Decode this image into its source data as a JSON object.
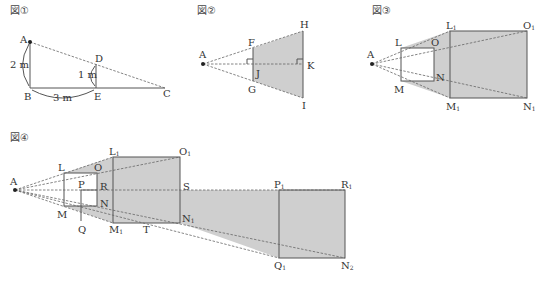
{
  "figures": [
    {
      "id": "fig1",
      "title": "図①",
      "points": {
        "A": "A",
        "B": "B",
        "C": "C",
        "D": "D",
        "E": "E"
      },
      "measurements": {
        "AB": "2 m",
        "BE": "3 m",
        "DE": "1 m"
      }
    },
    {
      "id": "fig2",
      "title": "図②",
      "points": {
        "A": "A",
        "F": "F",
        "G": "G",
        "H": "H",
        "I": "I",
        "J": "J",
        "K": "K"
      }
    },
    {
      "id": "fig3",
      "title": "図③",
      "points": {
        "A": "A",
        "L": "L",
        "O": "O",
        "M": "M",
        "N": "N",
        "L1": "L",
        "O1": "O",
        "M1": "M",
        "N1": "N",
        "sub1": "1"
      }
    },
    {
      "id": "fig4",
      "title": "図④",
      "points": {
        "A": "A",
        "L": "L",
        "O": "O",
        "M": "M",
        "N": "N",
        "P": "P",
        "Q": "Q",
        "R": "R",
        "S": "S",
        "T": "T",
        "L1": "L",
        "O1": "O",
        "M1": "M",
        "N1": "N",
        "P1": "P",
        "R1": "R",
        "Q1": "Q",
        "N2": "N",
        "sub1": "1",
        "sub2": "2"
      }
    }
  ],
  "colors": {
    "shade": "#cfcfcf",
    "line": "#555555",
    "text": "#333333"
  }
}
